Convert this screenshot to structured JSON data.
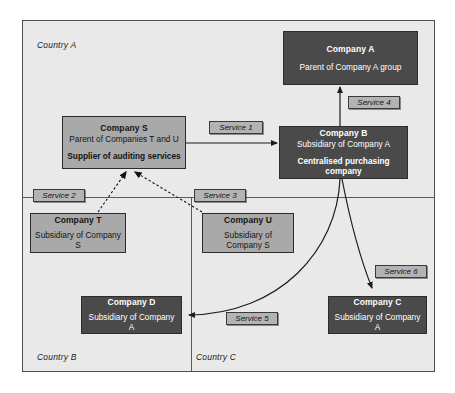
{
  "diagram": {
    "countries": [
      {
        "id": "country-a",
        "label": "Country A"
      },
      {
        "id": "country-b",
        "label": "Country B"
      },
      {
        "id": "country-c",
        "label": "Country C"
      }
    ],
    "entities": [
      {
        "id": "company-a",
        "name": "Company A",
        "relation": "Parent of Company A group",
        "role": "",
        "style": "dark"
      },
      {
        "id": "company-s",
        "name": "Company S",
        "relation": "Parent of Companies T and U",
        "role": "Supplier of auditing services",
        "style": "light"
      },
      {
        "id": "company-b",
        "name": "Company B",
        "relation": "Subsidiary of Company A",
        "role": "Centralised purchasing company",
        "style": "dark"
      },
      {
        "id": "company-t",
        "name": "Company T",
        "relation": "Subsidiary of Company S",
        "role": "",
        "style": "light"
      },
      {
        "id": "company-u",
        "name": "Company U",
        "relation": "Subsidiary of Company S",
        "role": "",
        "style": "light"
      },
      {
        "id": "company-d",
        "name": "Company D",
        "relation": "Subsidiary of Company A",
        "role": "",
        "style": "dark"
      },
      {
        "id": "company-c",
        "name": "Company C",
        "relation": "Subsidiary of Company A",
        "role": "",
        "style": "dark"
      }
    ],
    "services": [
      {
        "id": "service-1",
        "label": "Service 1"
      },
      {
        "id": "service-2",
        "label": "Service 2"
      },
      {
        "id": "service-3",
        "label": "Service 3"
      },
      {
        "id": "service-4",
        "label": "Service 4"
      },
      {
        "id": "service-5",
        "label": "Service 5"
      },
      {
        "id": "service-6",
        "label": "Service 6"
      }
    ],
    "colors": {
      "dark_box": "#4a4a4a",
      "light_box": "#a9a9a9",
      "frame_background": "#e9e9e9",
      "tag_fill": "#b3b3b3",
      "line": "#2b2b2b"
    }
  }
}
